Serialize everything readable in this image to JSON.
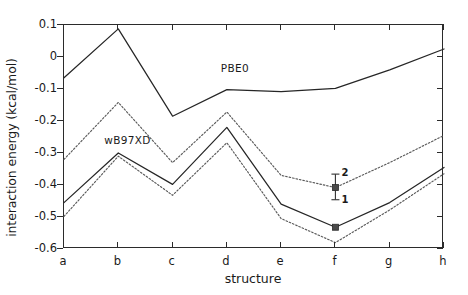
{
  "chart_data": {
    "type": "line",
    "title": "",
    "xlabel": "structure",
    "ylabel": "interaction energy (kcal/mol)",
    "categories": [
      "a",
      "b",
      "c",
      "d",
      "e",
      "f",
      "g",
      "h"
    ],
    "xlim": [
      0,
      7
    ],
    "ylim": [
      -0.6,
      0.1
    ],
    "yticks": [
      0.1,
      0,
      -0.1,
      -0.2,
      -0.3,
      -0.4,
      -0.5,
      -0.6
    ],
    "ytick_labels": [
      "0.1",
      "0",
      "-0.1",
      "-0.2",
      "-0.3",
      "-0.4",
      "-0.5",
      "-0.6"
    ],
    "grid": false,
    "legend": "inline-labels",
    "series": [
      {
        "name": "PBE0",
        "style": "solid",
        "label_position": "inline",
        "values": [
          -0.065,
          0.088,
          -0.185,
          -0.102,
          -0.108,
          -0.098,
          -0.04,
          0.025
        ]
      },
      {
        "name": "PBE0 upper dotted",
        "style": "dotted",
        "label_position": "none",
        "values": [
          -0.32,
          -0.142,
          -0.33,
          -0.172,
          -0.37,
          -0.408,
          -0.33,
          -0.245
        ]
      },
      {
        "name": "wB97XD",
        "style": "solid",
        "label_position": "inline",
        "values": [
          -0.455,
          -0.3,
          -0.398,
          -0.22,
          -0.46,
          -0.532,
          -0.455,
          -0.345
        ]
      },
      {
        "name": "wB97XD lower dotted",
        "style": "dotted",
        "label_position": "none",
        "values": [
          -0.498,
          -0.31,
          -0.432,
          -0.268,
          -0.505,
          -0.58,
          -0.478,
          -0.365
        ]
      }
    ],
    "annotations": [
      {
        "name": "error-bar-1",
        "label": "1",
        "at_category": "f",
        "value": -0.532,
        "marker": "square",
        "label_side": "right"
      },
      {
        "name": "error-bar-2",
        "label": "2",
        "at_category": "f",
        "value": -0.408,
        "err_low": 0.038,
        "err_high": 0.042,
        "marker": "square",
        "label_side": "right"
      }
    ]
  },
  "series_tags": {
    "pbe0": "PBE0",
    "wb97xd": "wB97XD"
  },
  "annotation_labels": {
    "one": "1",
    "two": "2"
  },
  "colors": {
    "axis": "#2b2b2b",
    "solid_line": "#262626",
    "dotted_line": "#5a5a5a",
    "marker": "#4a4a4a",
    "background": "#ffffff"
  }
}
